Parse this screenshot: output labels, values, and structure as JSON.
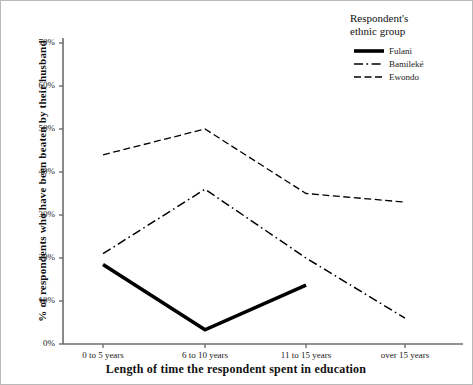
{
  "chart_data": {
    "type": "line",
    "title": "",
    "xlabel": "Length of time the respondent spent in education",
    "ylabel": "% of respondents who have been beaten by their husband",
    "categories": [
      "0 to 5 years",
      "6 to 10 years",
      "11 to 15 years",
      "over 15 years"
    ],
    "ylim": [
      0,
      70
    ],
    "ytick_labels": [
      "0%",
      "10%",
      "20%",
      "30%",
      "40%",
      "50%",
      "60%",
      "70%"
    ],
    "ytick_values": [
      0,
      10,
      20,
      30,
      40,
      50,
      60,
      70
    ],
    "grid": false,
    "legend_position": "top-right",
    "legend_title": "Respondent's ethnic group",
    "series": [
      {
        "name": "Fulani",
        "style": "solid-thick",
        "color": "#000000",
        "values": [
          18.5,
          3.3,
          13.7,
          null
        ]
      },
      {
        "name": "Bamileké",
        "style": "dash-dot",
        "color": "#000000",
        "values": [
          21,
          36,
          20,
          6
        ]
      },
      {
        "name": "Ewondo",
        "style": "dashed",
        "color": "#000000",
        "values": [
          44,
          50,
          35,
          33
        ]
      }
    ]
  },
  "legend": {
    "title_line1": "Respondent's",
    "title_line2": "ethnic group",
    "items": [
      {
        "label": "Fulani",
        "icon": "thick-solid-line-icon"
      },
      {
        "label": "Bamileké",
        "icon": "dash-dot-line-icon"
      },
      {
        "label": "Ewondo",
        "icon": "dashed-line-icon"
      }
    ]
  },
  "axes": {
    "x_title": "Length of time the respondent spent in education",
    "y_title": "% of respondents who have been beaten by their husband",
    "x_labels": [
      "0 to 5 years",
      "6 to 10 years",
      "11 to 15 years",
      "over 15 years"
    ],
    "y_labels": [
      "70%",
      "60%",
      "50%",
      "40%",
      "30%",
      "20%",
      "10%",
      "0%"
    ]
  }
}
